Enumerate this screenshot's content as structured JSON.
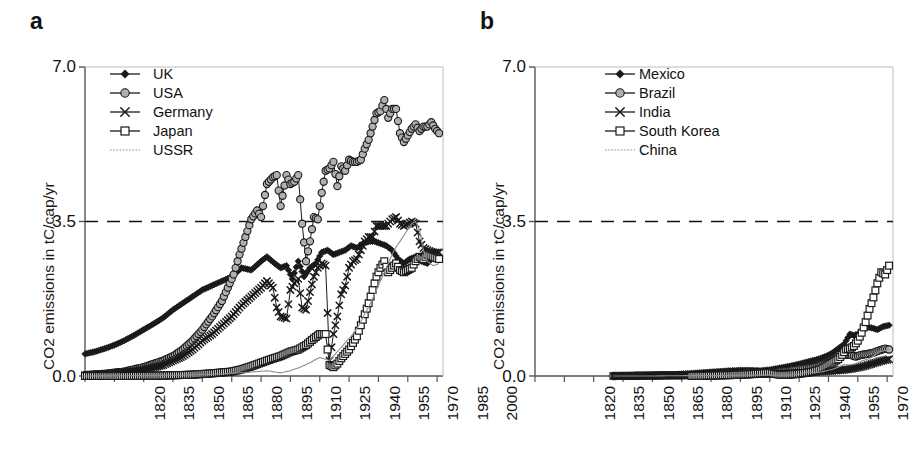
{
  "figure": {
    "panel_a_label": "a",
    "panel_b_label": "b",
    "ylabel": "CO2 emissions in tC/cap/yr",
    "yticks": [
      "0.0",
      "3.5",
      "7.0"
    ],
    "xticks": [
      "1820",
      "1835",
      "1850",
      "1865",
      "1880",
      "1895",
      "1910",
      "1925",
      "1940",
      "1955",
      "1970",
      "1985",
      "2000"
    ],
    "colors": {
      "axis": "#555555",
      "line": "#1a1a1a",
      "marker_gray": "#b0b0b0",
      "marker_white": "#ffffff",
      "thin_line": "#8c8c8c",
      "threshold": "#111111"
    },
    "threshold_value": 3.5
  },
  "legend_a": {
    "items": [
      {
        "label": "UK",
        "marker": "filled-diamond-marker"
      },
      {
        "label": "USA",
        "marker": "gray-circle-marker"
      },
      {
        "label": "Germany",
        "marker": "cross-x-marker"
      },
      {
        "label": "Japan",
        "marker": "open-square-marker"
      },
      {
        "label": "USSR",
        "marker": "dotted-line-marker"
      }
    ]
  },
  "legend_b": {
    "items": [
      {
        "label": "Mexico",
        "marker": "filled-diamond-marker"
      },
      {
        "label": "Brazil",
        "marker": "gray-circle-marker"
      },
      {
        "label": "India",
        "marker": "cross-x-marker"
      },
      {
        "label": "South Korea",
        "marker": "open-square-marker"
      },
      {
        "label": "China",
        "marker": "dotted-line-marker"
      }
    ]
  },
  "chart_data": [
    {
      "type": "line",
      "panel": "a",
      "title": "a",
      "xlabel": "",
      "ylabel": "CO2 emissions in tC/cap/yr",
      "xlim": [
        1820,
        2003
      ],
      "ylim": [
        0.0,
        7.0
      ],
      "yticks": [
        0.0,
        3.5,
        7.0
      ],
      "xticks": [
        1820,
        1835,
        1850,
        1865,
        1880,
        1895,
        1910,
        1925,
        1940,
        1955,
        1970,
        1985,
        2000
      ],
      "grid": false,
      "legend_position": "top-left-inside",
      "threshold_line": {
        "y": 3.5,
        "style": "dashed"
      },
      "series": [
        {
          "name": "UK",
          "marker": "filled-diamond",
          "x": [
            1820,
            1825,
            1830,
            1835,
            1840,
            1845,
            1850,
            1855,
            1860,
            1865,
            1870,
            1875,
            1880,
            1885,
            1890,
            1895,
            1900,
            1905,
            1910,
            1913,
            1917,
            1920,
            1923,
            1926,
            1929,
            1932,
            1935,
            1938,
            1941,
            1944,
            1947,
            1950,
            1953,
            1956,
            1959,
            1962,
            1965,
            1968,
            1971,
            1974,
            1977,
            1980,
            1983,
            1986,
            1989,
            1992,
            1995,
            1998,
            2001
          ],
          "values": [
            0.5,
            0.55,
            0.62,
            0.7,
            0.8,
            0.92,
            1.05,
            1.18,
            1.32,
            1.5,
            1.65,
            1.8,
            1.95,
            2.05,
            2.15,
            2.25,
            2.45,
            2.4,
            2.6,
            2.7,
            2.55,
            2.45,
            2.5,
            2.2,
            2.6,
            2.25,
            2.45,
            2.55,
            2.8,
            2.85,
            2.75,
            2.8,
            2.85,
            2.95,
            2.9,
            3.0,
            3.05,
            3.05,
            3.0,
            2.95,
            2.85,
            2.65,
            2.55,
            2.65,
            2.7,
            2.6,
            2.55,
            2.7,
            2.65
          ]
        },
        {
          "name": "USA",
          "marker": "gray-circle",
          "x": [
            1820,
            1830,
            1840,
            1850,
            1860,
            1865,
            1870,
            1875,
            1880,
            1885,
            1890,
            1893,
            1896,
            1899,
            1902,
            1905,
            1908,
            1910,
            1913,
            1916,
            1918,
            1920,
            1923,
            1925,
            1927,
            1929,
            1931,
            1933,
            1935,
            1937,
            1939,
            1941,
            1943,
            1945,
            1947,
            1949,
            1951,
            1953,
            1955,
            1957,
            1959,
            1961,
            1963,
            1965,
            1967,
            1969,
            1971,
            1973,
            1975,
            1977,
            1979,
            1981,
            1983,
            1985,
            1987,
            1989,
            1991,
            1993,
            1995,
            1997,
            1999,
            2001
          ],
          "values": [
            0.02,
            0.05,
            0.1,
            0.2,
            0.35,
            0.45,
            0.6,
            0.8,
            1.05,
            1.35,
            1.7,
            2.0,
            2.3,
            2.75,
            3.15,
            3.55,
            3.75,
            3.6,
            4.35,
            4.5,
            4.55,
            3.85,
            4.55,
            4.35,
            4.4,
            4.55,
            3.45,
            2.6,
            3.05,
            3.6,
            3.55,
            4.15,
            4.65,
            4.7,
            4.85,
            4.3,
            4.75,
            4.65,
            4.9,
            4.85,
            4.85,
            4.9,
            5.15,
            5.35,
            5.65,
            5.95,
            6.0,
            6.25,
            5.85,
            6.05,
            6.05,
            5.5,
            5.3,
            5.45,
            5.6,
            5.7,
            5.55,
            5.65,
            5.65,
            5.75,
            5.6,
            5.5
          ]
        },
        {
          "name": "Germany",
          "marker": "cross-x",
          "x": [
            1820,
            1830,
            1840,
            1850,
            1860,
            1870,
            1875,
            1880,
            1885,
            1890,
            1895,
            1900,
            1905,
            1910,
            1913,
            1916,
            1918,
            1920,
            1923,
            1925,
            1927,
            1929,
            1931,
            1933,
            1935,
            1937,
            1939,
            1941,
            1943,
            1945,
            1947,
            1949,
            1951,
            1953,
            1955,
            1957,
            1959,
            1961,
            1963,
            1965,
            1967,
            1969,
            1971,
            1974,
            1977,
            1979,
            1981,
            1983,
            1985,
            1987,
            1989,
            1991,
            1993,
            1995,
            1998,
            2001
          ],
          "values": [
            0.02,
            0.04,
            0.08,
            0.14,
            0.25,
            0.45,
            0.6,
            0.8,
            0.95,
            1.15,
            1.35,
            1.6,
            1.8,
            2.0,
            2.15,
            2.0,
            1.55,
            1.35,
            1.3,
            1.95,
            2.1,
            2.2,
            1.55,
            1.5,
            1.9,
            2.25,
            2.45,
            2.55,
            2.5,
            0.35,
            0.95,
            1.35,
            1.85,
            2.05,
            2.45,
            2.6,
            2.65,
            2.85,
            3.05,
            3.15,
            3.15,
            3.4,
            3.4,
            3.4,
            3.55,
            3.6,
            3.45,
            3.4,
            3.45,
            3.5,
            3.45,
            3.05,
            2.9,
            2.85,
            2.8,
            2.8
          ]
        },
        {
          "name": "Japan",
          "marker": "open-square",
          "x": [
            1820,
            1840,
            1860,
            1875,
            1885,
            1895,
            1900,
            1905,
            1910,
            1915,
            1920,
            1925,
            1929,
            1933,
            1937,
            1940,
            1943,
            1945,
            1947,
            1949,
            1951,
            1953,
            1955,
            1957,
            1959,
            1961,
            1963,
            1965,
            1967,
            1969,
            1971,
            1973,
            1975,
            1977,
            1979,
            1981,
            1983,
            1985,
            1987,
            1989,
            1991,
            1993,
            1995,
            1998,
            2001
          ],
          "values": [
            0.0,
            0.0,
            0.01,
            0.03,
            0.06,
            0.1,
            0.15,
            0.22,
            0.3,
            0.38,
            0.45,
            0.55,
            0.6,
            0.7,
            0.85,
            0.95,
            0.95,
            0.25,
            0.2,
            0.28,
            0.4,
            0.5,
            0.6,
            0.75,
            0.9,
            1.15,
            1.4,
            1.65,
            1.95,
            2.25,
            2.45,
            2.6,
            2.35,
            2.45,
            2.55,
            2.4,
            2.35,
            2.4,
            2.45,
            2.6,
            2.7,
            2.65,
            2.75,
            2.7,
            2.65
          ]
        },
        {
          "name": "USSR",
          "marker": "dotted-line",
          "x": [
            1820,
            1850,
            1870,
            1885,
            1895,
            1905,
            1913,
            1920,
            1925,
            1930,
            1935,
            1940,
            1945,
            1948,
            1951,
            1954,
            1957,
            1960,
            1963,
            1966,
            1969,
            1972,
            1975,
            1978,
            1981,
            1984,
            1987,
            1989,
            1991,
            1993,
            1995,
            1998,
            2001
          ],
          "values": [
            0.0,
            0.01,
            0.02,
            0.04,
            0.06,
            0.09,
            0.12,
            0.07,
            0.12,
            0.2,
            0.3,
            0.42,
            0.35,
            0.5,
            0.65,
            0.8,
            0.95,
            1.15,
            1.4,
            1.65,
            1.95,
            2.25,
            2.55,
            2.85,
            3.05,
            3.25,
            3.45,
            3.5,
            3.3,
            2.85,
            2.6,
            2.5,
            2.55
          ]
        }
      ]
    },
    {
      "type": "line",
      "panel": "b",
      "title": "b",
      "xlabel": "",
      "ylabel": "CO2 emissions in tC/cap/yr",
      "xlim": [
        1820,
        2003
      ],
      "ylim": [
        0.0,
        7.0
      ],
      "yticks": [
        0.0,
        3.5,
        7.0
      ],
      "xticks": [
        1820,
        1835,
        1850,
        1865,
        1880,
        1895,
        1910,
        1925,
        1940,
        1955,
        1970,
        1985,
        2000
      ],
      "grid": false,
      "legend_position": "top-center-inside",
      "threshold_line": {
        "y": 3.5,
        "style": "dashed"
      },
      "series": [
        {
          "name": "Mexico",
          "marker": "filled-diamond",
          "x": [
            1860,
            1870,
            1880,
            1890,
            1900,
            1910,
            1920,
            1925,
            1930,
            1935,
            1940,
            1945,
            1950,
            1955,
            1960,
            1963,
            1966,
            1969,
            1972,
            1975,
            1978,
            1981,
            1983,
            1985,
            1987,
            1989,
            1991,
            1993,
            1995,
            1998,
            2001
          ],
          "values": [
            0.0,
            0.01,
            0.02,
            0.03,
            0.06,
            0.09,
            0.12,
            0.13,
            0.13,
            0.12,
            0.14,
            0.18,
            0.22,
            0.27,
            0.33,
            0.36,
            0.4,
            0.45,
            0.52,
            0.62,
            0.72,
            0.95,
            0.92,
            0.95,
            1.0,
            1.1,
            1.1,
            1.08,
            1.05,
            1.12,
            1.15
          ]
        },
        {
          "name": "Brazil",
          "marker": "gray-circle",
          "x": [
            1860,
            1880,
            1900,
            1910,
            1920,
            1930,
            1940,
            1950,
            1955,
            1960,
            1965,
            1970,
            1975,
            1978,
            1981,
            1984,
            1987,
            1990,
            1993,
            1996,
            1999,
            2001
          ],
          "values": [
            0.0,
            0.01,
            0.02,
            0.03,
            0.05,
            0.06,
            0.08,
            0.12,
            0.15,
            0.18,
            0.22,
            0.3,
            0.42,
            0.48,
            0.48,
            0.44,
            0.48,
            0.5,
            0.53,
            0.58,
            0.62,
            0.6
          ]
        },
        {
          "name": "India",
          "marker": "cross-x",
          "x": [
            1860,
            1880,
            1900,
            1910,
            1920,
            1930,
            1940,
            1950,
            1955,
            1960,
            1965,
            1970,
            1975,
            1980,
            1985,
            1988,
            1991,
            1994,
            1997,
            2001
          ],
          "values": [
            0.0,
            0.01,
            0.02,
            0.03,
            0.04,
            0.04,
            0.05,
            0.06,
            0.07,
            0.08,
            0.1,
            0.11,
            0.13,
            0.15,
            0.19,
            0.22,
            0.26,
            0.3,
            0.34,
            0.38
          ]
        },
        {
          "name": "South Korea",
          "marker": "open-square",
          "x": [
            1900,
            1920,
            1930,
            1940,
            1945,
            1950,
            1955,
            1960,
            1963,
            1966,
            1969,
            1972,
            1975,
            1977,
            1979,
            1981,
            1983,
            1985,
            1987,
            1989,
            1991,
            1993,
            1995,
            1997,
            1999,
            2001
          ],
          "values": [
            0.0,
            0.02,
            0.04,
            0.07,
            0.03,
            0.03,
            0.05,
            0.08,
            0.11,
            0.15,
            0.22,
            0.3,
            0.38,
            0.48,
            0.6,
            0.62,
            0.68,
            0.8,
            0.98,
            1.22,
            1.52,
            1.78,
            2.1,
            2.35,
            2.3,
            2.5
          ]
        },
        {
          "name": "China",
          "marker": "dotted-line",
          "x": [
            1860,
            1880,
            1900,
            1920,
            1930,
            1940,
            1950,
            1955,
            1960,
            1963,
            1966,
            1969,
            1972,
            1975,
            1978,
            1981,
            1984,
            1987,
            1990,
            1993,
            1996,
            1999,
            2001
          ],
          "values": [
            0.0,
            0.0,
            0.01,
            0.01,
            0.02,
            0.02,
            0.02,
            0.04,
            0.1,
            0.07,
            0.09,
            0.12,
            0.15,
            0.2,
            0.26,
            0.25,
            0.28,
            0.34,
            0.38,
            0.45,
            0.55,
            0.58,
            0.62
          ]
        }
      ]
    }
  ]
}
